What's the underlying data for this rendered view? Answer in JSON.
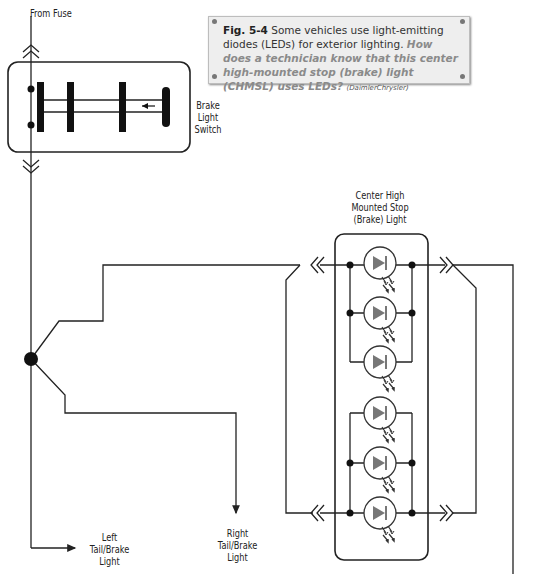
{
  "caption": {
    "figure_label": "Fig. 5-4",
    "text": "Some vehicles use light-emitting diodes (LEDs) for exterior lighting.",
    "question": "How does a technician know that this center high-mounted stop (brake) light (CHMSL) uses LEDs?",
    "credit": "(DaimlerChrysler)"
  },
  "labels": {
    "from_fuse": "From Fuse",
    "brake_switch": [
      "Brake",
      "Light",
      "Switch"
    ],
    "chmsl": [
      "Center High",
      "Mounted Stop",
      "(Brake) Light"
    ],
    "left_tail": [
      "Left",
      "Tail/Brake",
      "Light"
    ],
    "right_tail": [
      "Right",
      "Tail/Brake",
      "Light"
    ]
  },
  "components": {
    "led_count": 6,
    "led_color": "#666666",
    "wire_color": "#222222"
  }
}
